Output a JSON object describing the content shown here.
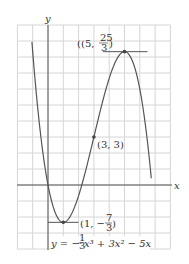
{
  "figure": {
    "axis_x_label": "x",
    "axis_y_label": "y",
    "equation": "y = −⅓x³ + 3x² − 5x",
    "equation_parts": {
      "lhs": "y = −",
      "frac_num": "1",
      "frac_den": "3",
      "rest": "x³ + 3x² − 5x"
    },
    "points": [
      {
        "name": "local-max",
        "x": 5,
        "y": 8.3333,
        "label_prefix": "(5, ",
        "label_num": "25",
        "label_den": "3",
        "label_suffix": ")"
      },
      {
        "name": "inflection",
        "x": 3,
        "y": 3,
        "label": "(3, 3)"
      },
      {
        "name": "local-min",
        "x": 1,
        "y": -2.3333,
        "label_prefix": "(1, −",
        "label_num": "7",
        "label_den": "3",
        "label_suffix": ")"
      }
    ],
    "grid": {
      "x_min": -2,
      "x_max": 8,
      "y_min": -4,
      "y_max": 10
    },
    "colors": {
      "grid": "#d6d6d6",
      "axis": "#555555",
      "curve": "#555555",
      "point": "#444444"
    }
  },
  "chart_data": {
    "type": "line",
    "title": "",
    "function": "y = -(1/3)x^3 + 3x^2 - 5x",
    "xlabel": "x",
    "ylabel": "y",
    "xlim": [
      -2,
      8
    ],
    "ylim": [
      -4,
      10
    ],
    "grid": true,
    "series": [
      {
        "name": "y = -1/3 x^3 + 3x^2 - 5x",
        "x": [
          -1,
          0,
          1,
          2,
          3,
          4,
          5,
          6,
          6.5
        ],
        "values": [
          8.33,
          0,
          -2.33,
          -0.67,
          3,
          6.67,
          8.33,
          6,
          2.54
        ]
      }
    ],
    "annotations": [
      "(5, 25/3)",
      "(3, 3)",
      "(1, -7/3)",
      "y = -1/3 x^3 + 3x^2 - 5x"
    ]
  }
}
